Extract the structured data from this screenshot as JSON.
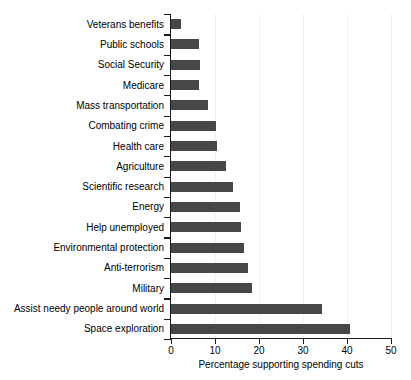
{
  "chart_data": {
    "type": "bar",
    "orientation": "horizontal",
    "title": "",
    "xlabel": "Percentage supporting spending cuts",
    "ylabel": "",
    "xlim": [
      0,
      50
    ],
    "xticks": [
      0,
      10,
      20,
      30,
      40,
      50
    ],
    "grid": "vertical-light",
    "legend": "none",
    "bar_color": "#474747",
    "categories": [
      "Veterans benefits",
      "Public schools",
      "Social Security",
      "Medicare",
      "Mass transportation",
      "Combating crime",
      "Health care",
      "Agriculture",
      "Scientific research",
      "Energy",
      "Help unemployed",
      "Environmental protection",
      "Anti-terrorism",
      "Military",
      "Assist needy people around world",
      "Space exploration"
    ],
    "values": [
      2.3,
      6.3,
      6.5,
      6.4,
      8.4,
      10.3,
      10.5,
      12.4,
      14.2,
      15.6,
      16.0,
      16.7,
      17.4,
      18.3,
      34.3,
      40.7
    ]
  }
}
